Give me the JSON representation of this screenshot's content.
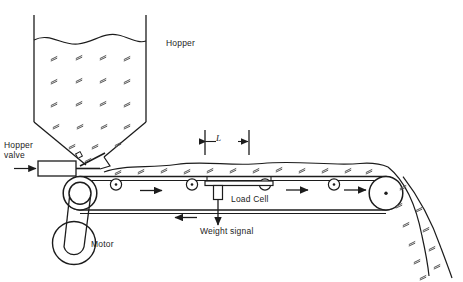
{
  "diagram": {
    "type": "process-equipment-schematic",
    "background_color": "#ffffff",
    "line_color": "#1c1c1c",
    "hatch_color": "#555555",
    "labels": {
      "hopper": "Hopper",
      "hopper_valve": "Hopper\nvalve",
      "load_cell": "Load Cell",
      "weight_signal": "Weight signal",
      "motor": "Motor",
      "span_length": "L"
    },
    "components": [
      {
        "name": "hopper",
        "label": "Hopper",
        "shape": "vertical-walled bin with conical outlet",
        "fill": "granular-hatch"
      },
      {
        "name": "material-surface",
        "label": "",
        "shape": "wavy free-surface line at top of hopper"
      },
      {
        "name": "hopper-valve",
        "label": "Hopper valve",
        "shape": "rectangular actuator with inclined slide gate"
      },
      {
        "name": "valve-actuator-arrow",
        "label": "",
        "shape": "arrow pointing right into actuator"
      },
      {
        "name": "conveyor-belt",
        "label": "",
        "shape": "endless belt over tail and head pulleys"
      },
      {
        "name": "tail-pulley",
        "label": "",
        "shape": "double circle pulley at left"
      },
      {
        "name": "head-pulley",
        "label": "",
        "shape": "circle pulley with center dot at right"
      },
      {
        "name": "idler-rollers",
        "label": "",
        "count": 4,
        "shape": "small circles with center dot supporting carry side"
      },
      {
        "name": "weigh-platform",
        "label": "",
        "shape": "horizontal bar of span L beneath belt"
      },
      {
        "name": "load-cell",
        "label": "Load Cell",
        "shape": "vertical column under weigh platform"
      },
      {
        "name": "weight-signal",
        "label": "Weight signal",
        "shape": "downward signal arrow from load cell"
      },
      {
        "name": "motor",
        "label": "Motor",
        "shape": "circular pulley driven by V-belt to tail pulley"
      },
      {
        "name": "belt-travel-arrows",
        "label": "",
        "count": 3,
        "shape": "arrows showing carry side moving right"
      },
      {
        "name": "return-arrow",
        "label": "",
        "shape": "arrow showing return side moving left"
      },
      {
        "name": "discharge-stream",
        "label": "",
        "shape": "curved falling material stream at head pulley",
        "fill": "granular-hatch"
      }
    ],
    "annotations": [
      {
        "name": "span-dimension",
        "label": "L",
        "description": "weighing span between dimension witness lines"
      }
    ]
  }
}
